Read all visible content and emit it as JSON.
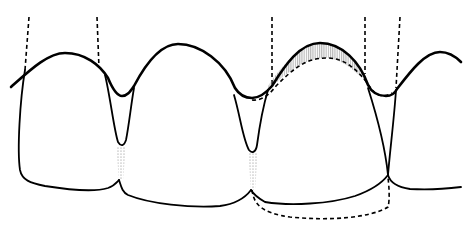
{
  "diagram": {
    "teeth_count": 4,
    "elements": {
      "gingival_margin": "solid thick wavy line",
      "tooth_outlines": "solid lines",
      "root_axes": "dashed vertical lines",
      "contact_areas": "stippled interproximal zones",
      "graft_area": "vertically hatched crescent over third tooth",
      "proposed_outline": "dashed incisal and gingival contour"
    },
    "colors": {
      "line": "#000000",
      "background": "#ffffff",
      "shading": "#9a9a9a"
    }
  }
}
